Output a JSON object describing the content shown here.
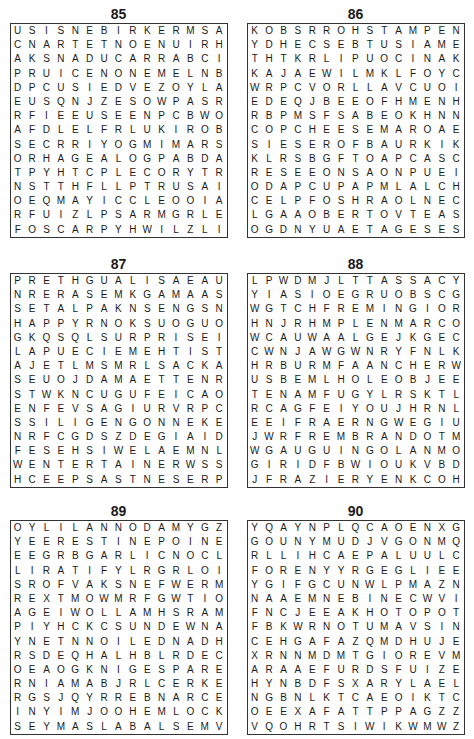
{
  "puzzles": [
    {
      "number": "85",
      "rows": [
        "USISNEBIRKERMSA",
        "CNARTETNOENUIRH",
        "AKSNADUCARRABCI",
        "PRUICENONEMELNB",
        "DPCUSIEDVEZOYLA",
        "EUSQNJZESOWPASR",
        "RFIEEUSEENPCBWO",
        "AFDLELFRLUKIROB",
        "SECRRIYOGMIMARS",
        "ORHAGEALOGPABDA",
        "TPYHTCPLECORYTR",
        "NSTTHFLLPTRUSAI",
        "OEQMAYICCLEOOIA",
        "RFUIZLPSARMGRLE",
        "FOSCARPYHWILZLI"
      ]
    },
    {
      "number": "86",
      "rows": [
        "KOBSRROHSTAMPEN",
        "YDHECSEBTUSIAME",
        "THTKRLIPUOCINAK",
        "KAJAEWILMKLFOYC",
        "WRPCVORLLAVCUOI",
        "EDEQJBEEOFHMENH",
        "RBPMSFSABEOKHNN",
        "COPCHEESEMAROAE",
        "SIESEROFBAURKIK",
        "KLRSBGFTOAPCASC",
        "RESEEONSAONPUEI",
        "ODAPCUPAPMLALCH",
        "CELPFOSHRAOLNEC",
        "LGAAOBERTOVTEAS",
        "OGDNYUAETAGESES"
      ]
    },
    {
      "number": "87",
      "rows": [
        "PRETHGUALISAEAU",
        "NRERASEMKGAMAAS",
        "SETALPAKNSENGSN",
        "HAPPYRNOKSUOGUO",
        "GKQSQLSURPRISEI",
        "LAPUECIEMEHTIST",
        "AJETLMSMRLSACKA",
        "SEUOJDAMAETTENR",
        "STWKNCUGUFEICAO",
        "ENFEVSAGIURVRPC",
        "SSILIGENGONNEKE",
        "NRFCGDSZDEGIAID",
        "FESEHSIWELAEMNL",
        "WENTERTAINERWSS",
        "HCEEPSASTNESERP"
      ]
    },
    {
      "number": "88",
      "rows": [
        "LPWDMJLTTASSACY",
        "YIASIOEGRUOBSCG",
        "WGTCHFREMINGIOR",
        "HNJRHMPLENMARCO",
        "WCAUWAALGEJKGEC",
        "CWNJAWGWNRYFNLK",
        "HRBURMFAANCHERW",
        "USBEMLHOLEOBJEE",
        "TENAMFUGYLRSKTL",
        "RCAGFEIYOUJHRNL",
        "EEIFRAERNGWEGIU",
        "JWRFREMBRANDOTMN",
        "WGAUGUINGOLANMO",
        "GIRIDFBWIOUKVBD",
        "JFRAZIERYENKCOH"
      ]
    },
    {
      "number": "89",
      "rows": [
        "OYLILANNODAMYGZ",
        "YEERESTINEPOINE",
        "EEGRBGARLICNOCL",
        "LIRATIFYLRGRLOI",
        "SROFVAKSNEFWERM",
        "REXTMOWMRFGWTIO",
        "AGEIWOLLAMHSRAM",
        "PIYHCKCSUNDEWNA",
        "YNETNNOILEDNADH",
        "RSDEQHALHBLRDEC",
        "OEAOGKNIGESPARE",
        "RNIAMABJRLCERKE",
        "RGSJQYRREBNARCE",
        "INYIMJOOHEMLOCK",
        "SEYMASLABALSEMV"
      ]
    },
    {
      "number": "90",
      "rows": [
        "YQAYNPLQCAOENXG",
        "GOUNYMUDJVGONMQ",
        "RLLIHCAEPALUULC",
        "FORENYYRGEGLIEE",
        "YGIFGCUNWLPMAZN",
        "NAAEMNEBINECWVI",
        "FNCJEEAKHOTOPOT",
        "FBKWRNOTUMAVSIN",
        "CEHGAFAZQMDHUJE",
        "XRNNMDMTGIOREVM",
        "ARAAEFURDSFUIZE",
        "HYNBDFSXARYLAEL",
        "NGBNLKTCAEOIKTC",
        "OEEXAFATTPPAGZZ",
        "VQOHRTSIWIKWMWZ"
      ]
    }
  ]
}
